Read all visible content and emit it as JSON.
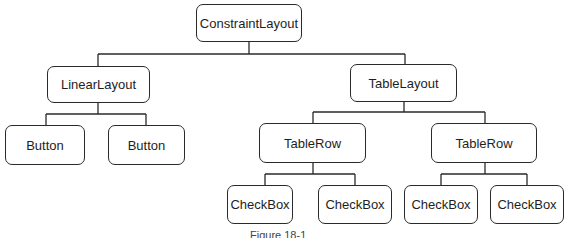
{
  "diagram": {
    "type": "tree",
    "root": {
      "label": "ConstraintLayout",
      "children": [
        {
          "label": "LinearLayout",
          "children": [
            {
              "label": "Button"
            },
            {
              "label": "Button"
            }
          ]
        },
        {
          "label": "TableLayout",
          "children": [
            {
              "label": "TableRow",
              "children": [
                {
                  "label": "CheckBox"
                },
                {
                  "label": "CheckBox"
                }
              ]
            },
            {
              "label": "TableRow",
              "children": [
                {
                  "label": "CheckBox"
                },
                {
                  "label": "CheckBox"
                }
              ]
            }
          ]
        }
      ]
    },
    "nodes": {
      "constraint_layout": "ConstraintLayout",
      "linear_layout": "LinearLayout",
      "table_layout": "TableLayout",
      "button_1": "Button",
      "button_2": "Button",
      "table_row_1": "TableRow",
      "table_row_2": "TableRow",
      "checkbox_1": "CheckBox",
      "checkbox_2": "CheckBox",
      "checkbox_3": "CheckBox",
      "checkbox_4": "CheckBox"
    },
    "caption": "Figure 18-1"
  }
}
